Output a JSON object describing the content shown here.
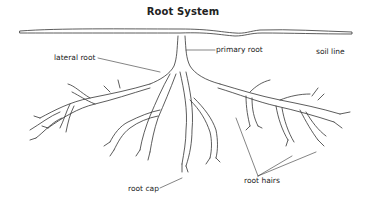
{
  "title": "Root System",
  "labels": {
    "soil_line": "soil line",
    "primary_root": "primary root",
    "lateral_root": "lateral root",
    "root_cap": "root cap",
    "root_hairs": "root hairs"
  },
  "colors": {
    "line": "#333333",
    "text": "#222222",
    "background": "#ffffff"
  }
}
